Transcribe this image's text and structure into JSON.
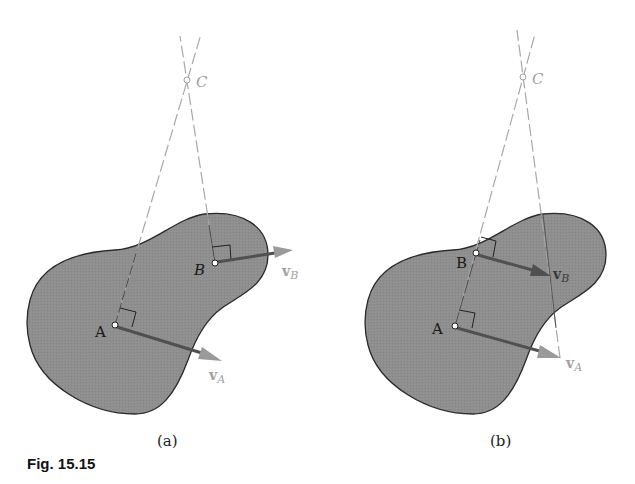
{
  "figure": {
    "caption": "Fig. 15.15",
    "colors": {
      "blob_fill": "#8e8e8e",
      "blob_stroke": "#2a2a2a",
      "construction_line": "#a8a8a8",
      "velocity_arrow": "#505050",
      "arrow_head": "#9a9a9a",
      "light_label": "#a0a0a0",
      "dark_label": "#1a1a1a"
    },
    "panels": [
      {
        "id": "a",
        "label": "(a)",
        "points": {
          "A": {
            "label": "A"
          },
          "B": {
            "label": "B"
          },
          "C": {
            "label": "C"
          }
        },
        "vectors": {
          "vA": {
            "label": "v",
            "subscript": "A"
          },
          "vB": {
            "label": "v",
            "subscript": "B"
          }
        }
      },
      {
        "id": "b",
        "label": "(b)",
        "points": {
          "A": {
            "label": "A"
          },
          "B": {
            "label": "B"
          },
          "C": {
            "label": "C"
          }
        },
        "vectors": {
          "vA": {
            "label": "v",
            "subscript": "A"
          },
          "vB": {
            "label": "v",
            "subscript": "B"
          }
        }
      }
    ]
  }
}
